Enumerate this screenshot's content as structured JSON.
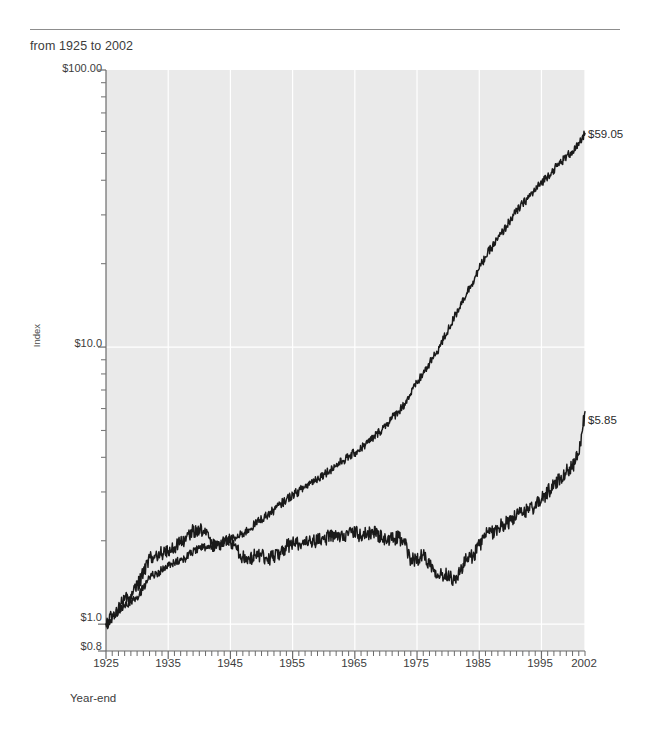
{
  "header": {
    "subtitle": "from 1925 to 2002"
  },
  "chart_data": {
    "type": "line",
    "title": "",
    "subtitle": "from 1925 to 2002",
    "xlabel": "Year-end",
    "ylabel": "Index",
    "yscale": "log",
    "ylim": [
      0.8,
      100.0
    ],
    "xlim": [
      1925,
      2002
    ],
    "grid": "white gridlines on light gray plot background",
    "legend_position": "inline annotations on curves",
    "ytick_labels": [
      "$100.00",
      "$10.0",
      "$1.0",
      "$0.8"
    ],
    "ytick_values": [
      100.0,
      10.0,
      1.0,
      0.8
    ],
    "xtick_labels": [
      "1925",
      "1935",
      "1945",
      "1955",
      "1965",
      "1975",
      "1985",
      "1995",
      "2002"
    ],
    "xtick_values": [
      1925,
      1935,
      1945,
      1955,
      1965,
      1975,
      1985,
      1995,
      2002
    ],
    "annotations": [
      {
        "name": "nominal-endpoint",
        "text": "$59.05",
        "value": 59.05,
        "year": 2002
      },
      {
        "name": "real-endpoint",
        "text": "$5.85",
        "value": 5.85,
        "year": 2002
      }
    ],
    "series": [
      {
        "name": "Nominal Total Return Index",
        "label": "Nominal Total Return Index",
        "color": "#1a1a1a",
        "final_value": 59.05,
        "x": [
          1925,
          1926,
          1927,
          1928,
          1929,
          1930,
          1931,
          1932,
          1933,
          1934,
          1935,
          1936,
          1937,
          1938,
          1939,
          1940,
          1941,
          1942,
          1943,
          1944,
          1945,
          1946,
          1947,
          1948,
          1949,
          1950,
          1951,
          1952,
          1953,
          1954,
          1955,
          1956,
          1957,
          1958,
          1959,
          1960,
          1961,
          1962,
          1963,
          1964,
          1965,
          1966,
          1967,
          1968,
          1969,
          1970,
          1971,
          1972,
          1973,
          1974,
          1975,
          1976,
          1977,
          1978,
          1979,
          1980,
          1981,
          1982,
          1983,
          1984,
          1985,
          1986,
          1987,
          1988,
          1989,
          1990,
          1991,
          1992,
          1993,
          1994,
          1995,
          1996,
          1997,
          1998,
          1999,
          2000,
          2001,
          2002
        ],
        "values": [
          1.0,
          1.06,
          1.12,
          1.17,
          1.21,
          1.26,
          1.35,
          1.48,
          1.52,
          1.57,
          1.62,
          1.66,
          1.7,
          1.75,
          1.82,
          1.88,
          1.9,
          1.88,
          1.92,
          1.97,
          2.02,
          2.05,
          2.12,
          2.2,
          2.3,
          2.4,
          2.48,
          2.58,
          2.7,
          2.82,
          2.93,
          3.02,
          3.13,
          3.26,
          3.36,
          3.48,
          3.6,
          3.74,
          3.88,
          4.01,
          4.16,
          4.32,
          4.5,
          4.72,
          4.96,
          5.25,
          5.55,
          5.86,
          6.24,
          6.8,
          7.42,
          8.05,
          8.7,
          9.45,
          10.4,
          11.55,
          12.8,
          14.3,
          15.7,
          17.3,
          19.2,
          21.2,
          22.9,
          24.6,
          26.5,
          28.8,
          30.9,
          32.9,
          34.9,
          36.9,
          39.3,
          41.5,
          43.8,
          46.2,
          48.6,
          51.0,
          53.5,
          59.05
        ]
      },
      {
        "name": "Real Total Return Index",
        "label": "Real Total Return Index",
        "color": "#1a1a1a",
        "final_value": 5.85,
        "x": [
          1925,
          1926,
          1927,
          1928,
          1929,
          1930,
          1931,
          1932,
          1933,
          1934,
          1935,
          1936,
          1937,
          1938,
          1939,
          1940,
          1941,
          1942,
          1943,
          1944,
          1945,
          1946,
          1947,
          1948,
          1949,
          1950,
          1951,
          1952,
          1953,
          1954,
          1955,
          1956,
          1957,
          1958,
          1959,
          1960,
          1961,
          1962,
          1963,
          1964,
          1965,
          1966,
          1967,
          1968,
          1969,
          1970,
          1971,
          1972,
          1973,
          1974,
          1975,
          1976,
          1977,
          1978,
          1979,
          1980,
          1981,
          1982,
          1983,
          1984,
          1985,
          1986,
          1987,
          1988,
          1989,
          1990,
          1991,
          1992,
          1993,
          1994,
          1995,
          1996,
          1997,
          1998,
          1999,
          2000,
          2001,
          2002
        ],
        "values": [
          1.0,
          1.07,
          1.15,
          1.22,
          1.28,
          1.38,
          1.52,
          1.75,
          1.78,
          1.8,
          1.84,
          1.9,
          1.96,
          2.08,
          2.16,
          2.22,
          2.12,
          1.96,
          1.94,
          1.96,
          2.0,
          1.86,
          1.74,
          1.72,
          1.78,
          1.76,
          1.72,
          1.76,
          1.82,
          1.9,
          1.96,
          1.96,
          1.94,
          1.98,
          2.0,
          2.02,
          2.08,
          2.06,
          2.1,
          2.12,
          2.14,
          2.08,
          2.12,
          2.16,
          2.08,
          2.0,
          2.02,
          2.06,
          1.96,
          1.7,
          1.72,
          1.78,
          1.66,
          1.56,
          1.5,
          1.52,
          1.44,
          1.56,
          1.72,
          1.76,
          1.92,
          2.1,
          2.14,
          2.22,
          2.3,
          2.36,
          2.46,
          2.52,
          2.62,
          2.66,
          2.82,
          3.0,
          3.18,
          3.38,
          3.56,
          3.72,
          4.1,
          5.85
        ]
      }
    ]
  }
}
